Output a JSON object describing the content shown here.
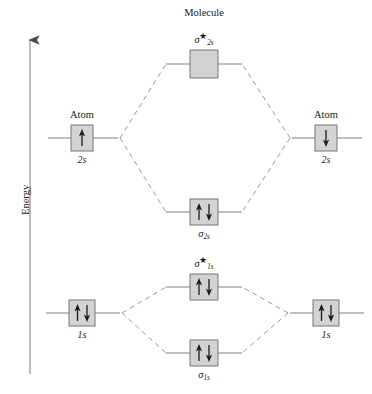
{
  "diagram": {
    "title_axis": "Energy",
    "headings": {
      "left_atom": "Atom",
      "molecule": "Molecule",
      "right_atom": "Atom"
    },
    "colors": {
      "box_fill": "#d3d3d3",
      "box_stroke": "#808080",
      "line": "#808080",
      "dashed_line": "#9a9a9a",
      "axis": "#999999",
      "arrow": "#1a1a1a",
      "text": "#1a1a1a",
      "background": "#ffffff"
    },
    "axis": {
      "label": "Energy",
      "direction": "up",
      "x": 30,
      "y_top": 36,
      "y_bottom": 374
    }
  },
  "levels": [
    {
      "id": "sigma-2s-antibonding",
      "side": "molecule",
      "label_base": "σ",
      "label_sub": "2s",
      "label_star": "★",
      "label_text": "σ*2s",
      "electrons": [],
      "electron_count": 0,
      "box": {
        "x": 190,
        "y": 50,
        "w": 28,
        "h": 28
      },
      "line": {
        "x1": 166,
        "x2": 242,
        "y": 64
      },
      "label_pos": {
        "x": 204,
        "y": 33
      }
    },
    {
      "id": "atom-left-2s",
      "side": "left-atom",
      "label_text": "2s",
      "label_sub": "",
      "electrons": [
        "up"
      ],
      "electron_count": 1,
      "box": {
        "x": 71,
        "y": 125,
        "w": 22,
        "h": 26
      },
      "line": {
        "x1": 48,
        "x2": 118,
        "y": 138
      },
      "label_pos": {
        "x": 82,
        "y": 154
      },
      "heading": "Atom",
      "heading_pos": {
        "x": 82,
        "y": 110
      }
    },
    {
      "id": "atom-right-2s",
      "side": "right-atom",
      "label_text": "2s",
      "label_sub": "",
      "electrons": [
        "down"
      ],
      "electron_count": 1,
      "box": {
        "x": 315,
        "y": 125,
        "w": 22,
        "h": 26
      },
      "line": {
        "x1": 292,
        "x2": 362,
        "y": 138
      },
      "label_pos": {
        "x": 326,
        "y": 154
      },
      "heading": "Atom",
      "heading_pos": {
        "x": 326,
        "y": 110
      }
    },
    {
      "id": "sigma-2s-bonding",
      "side": "molecule",
      "label_base": "σ",
      "label_sub": "2s",
      "label_star": "",
      "label_text": "σ2s",
      "electrons": [
        "up",
        "down"
      ],
      "electron_count": 2,
      "box": {
        "x": 190,
        "y": 199,
        "w": 28,
        "h": 26
      },
      "line": {
        "x1": 166,
        "x2": 242,
        "y": 212
      },
      "label_pos": {
        "x": 204,
        "y": 228
      }
    },
    {
      "id": "sigma-1s-antibonding",
      "side": "molecule",
      "label_base": "σ",
      "label_sub": "1s",
      "label_star": "★",
      "label_text": "σ*1s",
      "electrons": [
        "up",
        "down"
      ],
      "electron_count": 2,
      "box": {
        "x": 190,
        "y": 274,
        "w": 28,
        "h": 26
      },
      "line": {
        "x1": 166,
        "x2": 242,
        "y": 287
      },
      "label_pos": {
        "x": 204,
        "y": 262
      }
    },
    {
      "id": "atom-left-1s",
      "side": "left-atom",
      "label_text": "1s",
      "label_sub": "",
      "electrons": [
        "up",
        "down"
      ],
      "electron_count": 2,
      "box": {
        "x": 69,
        "y": 300,
        "w": 26,
        "h": 26
      },
      "line": {
        "x1": 46,
        "x2": 120,
        "y": 313
      },
      "label_pos": {
        "x": 82,
        "y": 330
      }
    },
    {
      "id": "atom-right-1s",
      "side": "right-atom",
      "label_text": "1s",
      "label_sub": "",
      "electrons": [
        "up",
        "down"
      ],
      "electron_count": 2,
      "box": {
        "x": 313,
        "y": 300,
        "w": 26,
        "h": 26
      },
      "line": {
        "x1": 290,
        "x2": 364,
        "y": 313
      },
      "label_pos": {
        "x": 326,
        "y": 330
      }
    },
    {
      "id": "sigma-1s-bonding",
      "side": "molecule",
      "label_base": "σ",
      "label_sub": "1s",
      "label_star": "",
      "label_text": "σ1s",
      "electrons": [
        "up",
        "down"
      ],
      "electron_count": 2,
      "box": {
        "x": 190,
        "y": 340,
        "w": 28,
        "h": 26
      },
      "line": {
        "x1": 166,
        "x2": 242,
        "y": 353
      },
      "label_pos": {
        "x": 204,
        "y": 369
      }
    }
  ],
  "correlation_lines": [
    {
      "from": "atom-left-2s",
      "to": "sigma-2s-antibonding",
      "style": "dashed"
    },
    {
      "from": "atom-left-2s",
      "to": "sigma-2s-bonding",
      "style": "dashed"
    },
    {
      "from": "atom-right-2s",
      "to": "sigma-2s-antibonding",
      "style": "dashed"
    },
    {
      "from": "atom-right-2s",
      "to": "sigma-2s-bonding",
      "style": "dashed"
    },
    {
      "from": "atom-left-1s",
      "to": "sigma-1s-antibonding",
      "style": "dashed"
    },
    {
      "from": "atom-left-1s",
      "to": "sigma-1s-bonding",
      "style": "dashed"
    },
    {
      "from": "atom-right-1s",
      "to": "sigma-1s-antibonding",
      "style": "dashed"
    },
    {
      "from": "atom-right-1s",
      "to": "sigma-1s-bonding",
      "style": "dashed"
    }
  ]
}
